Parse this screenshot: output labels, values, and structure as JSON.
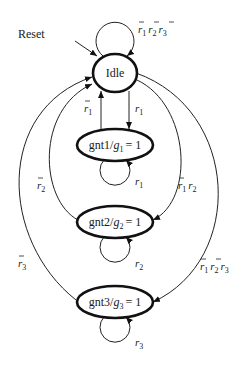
{
  "diagram": {
    "type": "finite-state-machine",
    "title": "",
    "reset_label": "Reset",
    "states": [
      {
        "id": "idle",
        "label": "Idle"
      },
      {
        "id": "gnt1",
        "label": "gnt1/g1 = 1",
        "name": "gnt1",
        "output_var": "g",
        "output_sub": "1",
        "output_val": "= 1"
      },
      {
        "id": "gnt2",
        "label": "gnt2/g2 = 1",
        "name": "gnt2",
        "output_var": "g",
        "output_sub": "2",
        "output_val": "= 1"
      },
      {
        "id": "gnt3",
        "label": "gnt3/g3 = 1",
        "name": "gnt3",
        "output_var": "g",
        "output_sub": "3",
        "output_val": "= 1"
      }
    ],
    "transitions": [
      {
        "from": "idle",
        "to": "idle",
        "condition": "r̄1 r̄2 r̄3"
      },
      {
        "from": "idle",
        "to": "gnt1",
        "condition": "r1"
      },
      {
        "from": "gnt1",
        "to": "idle",
        "condition": "r̄1"
      },
      {
        "from": "gnt1",
        "to": "gnt1",
        "condition": "r1"
      },
      {
        "from": "idle",
        "to": "gnt2",
        "condition": "r̄1 r2"
      },
      {
        "from": "gnt2",
        "to": "idle",
        "condition": "r̄2"
      },
      {
        "from": "gnt2",
        "to": "gnt2",
        "condition": "r2"
      },
      {
        "from": "idle",
        "to": "gnt3",
        "condition": "r̄1 r̄2 r3"
      },
      {
        "from": "gnt3",
        "to": "idle",
        "condition": "r̄3"
      },
      {
        "from": "gnt3",
        "to": "gnt3",
        "condition": "r3"
      }
    ],
    "text": {
      "reset": "Reset",
      "idle": "Idle",
      "gnt1_name": "gnt1/",
      "gnt2_name": "gnt2/",
      "gnt3_name": "gnt3/",
      "g": "g",
      "eq1": "= 1",
      "r": "r",
      "s1": "1",
      "s2": "2",
      "s3": "3"
    }
  }
}
